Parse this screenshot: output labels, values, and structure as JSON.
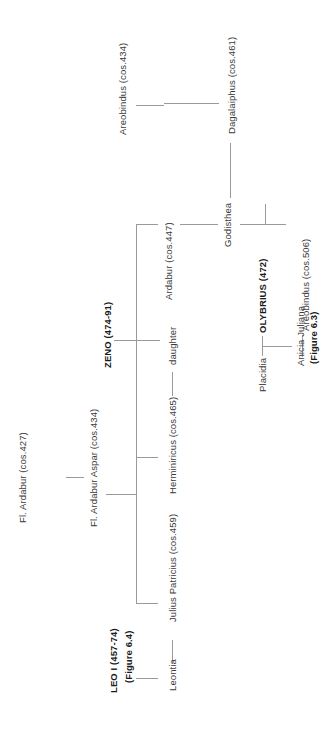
{
  "diagram": {
    "type": "family-tree",
    "orientation": "rotated-90-ccw",
    "people": {
      "areobindus_434": "Areobindus (cos.434)",
      "dagalaiphus": "Dagalaiphus  (cos.461)",
      "ardabur_447": "Ardabur (cos.447)",
      "godisthea": "Godisthea",
      "areobindus_506": "Areobindus  (cos.506)",
      "zeno": "ZENO (474-91)",
      "daughter": "daughter",
      "olybrius": "OLYBRIUS (472)",
      "anicia_juliana": "Anicia Juliana",
      "anicia_juliana_ref": "(Figure 6.3)",
      "placidia": "Placidia",
      "herminiricus": "Herminiricus (cos.465)",
      "fl_ardabur": "Fl. Ardabur (cos.427)",
      "aspar": "Fl. Ardabur Aspar (cos.434)",
      "julius_patricius": "Julius Patricius (cos.459)",
      "leo": "LEO I (457-74)",
      "leo_ref": "(Figure 6.4)",
      "leontia": "Leontia"
    },
    "relations": [
      {
        "type": "parent-child",
        "parent": "Areobindus (cos.434)",
        "child": "Dagalaiphus (cos.461)"
      },
      {
        "type": "marriage",
        "a": "Dagalaiphus (cos.461)",
        "b": "Godisthea"
      },
      {
        "type": "parent-child",
        "parent": "Fl. Ardabur Aspar (cos.434)",
        "child": "Godisthea"
      },
      {
        "type": "parent-child",
        "parent": "Dagalaiphus / Godisthea",
        "child": "Areobindus (cos.506)"
      },
      {
        "type": "marriage",
        "a": "Anicia Juliana",
        "b": "Areobindus (cos.506)"
      },
      {
        "type": "parent-child",
        "parent": "OLYBRIUS (472) / Placidia",
        "child": "Anicia Juliana"
      },
      {
        "type": "parent-child",
        "parent": "Fl. Ardabur (cos.427)",
        "child": "Fl. Ardabur Aspar (cos.434)"
      },
      {
        "type": "parent-child",
        "parent": "Fl. Ardabur Aspar (cos.434)",
        "child": "Ardabur (cos.447)"
      },
      {
        "type": "parent-child",
        "parent": "Fl. Ardabur Aspar (cos.434)",
        "child": "Herminiricus (cos.465)"
      },
      {
        "type": "parent-child",
        "parent": "Fl. Ardabur Aspar (cos.434)",
        "child": "Julius Patricius (cos.459)"
      },
      {
        "type": "marriage",
        "a": "Herminiricus (cos.465)",
        "b": "daughter"
      },
      {
        "type": "parent-child",
        "parent": "ZENO (474-91)",
        "child": "daughter"
      },
      {
        "type": "marriage",
        "a": "Leontia",
        "b": "Julius Patricius (cos.459)"
      },
      {
        "type": "parent-child",
        "parent": "LEO I (457-74)",
        "child": "Leontia"
      }
    ]
  }
}
